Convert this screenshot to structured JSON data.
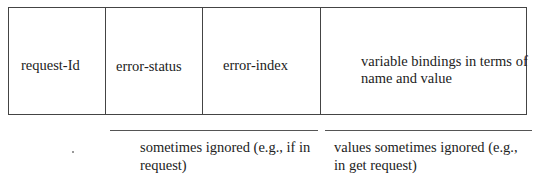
{
  "diagram": {
    "title": "",
    "fields": [
      {
        "label": "request-Id"
      },
      {
        "label": "error-status"
      },
      {
        "label": "error-index"
      },
      {
        "label": "variable bindings in terms of name and value"
      }
    ],
    "annotations": [
      {
        "spans_fields": [
          "error-status",
          "error-index"
        ],
        "text": "sometimes ignored (e.g., if in request)"
      },
      {
        "spans_fields": [
          "variable bindings in terms of name and value"
        ],
        "text": "values sometimes ignored (e.g., in get request)"
      }
    ]
  }
}
